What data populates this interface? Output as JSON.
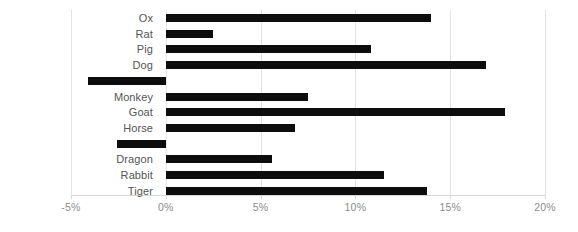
{
  "chart_data": {
    "type": "bar",
    "orientation": "horizontal",
    "title": "",
    "subtitle": "",
    "xlabel": "",
    "ylabel": "",
    "xlim": [
      -5,
      20
    ],
    "ylim": null,
    "grid": true,
    "legend": null,
    "legend_position": "none",
    "bar_color": "#0d0d0d",
    "axis_color": "#d8d8d8",
    "gridline_color": "#e4e4e4",
    "tick_label_color": "#8c8c8c",
    "category_label_color": "#555555",
    "xticks": [
      -5,
      0,
      5,
      10,
      15,
      20
    ],
    "xtick_labels": [
      "-5%",
      "0%",
      "5%",
      "10%",
      "15%",
      "20%"
    ],
    "categories": [
      "Ox",
      "Rat",
      "Pig",
      "Dog",
      "Rooster",
      "Monkey",
      "Goat",
      "Horse",
      "Snake",
      "Dragon",
      "Rabbit",
      "Tiger"
    ],
    "values": [
      14.0,
      2.5,
      10.8,
      16.9,
      -4.1,
      7.5,
      17.9,
      6.8,
      -2.6,
      5.6,
      11.5,
      13.8
    ],
    "annotations": []
  }
}
